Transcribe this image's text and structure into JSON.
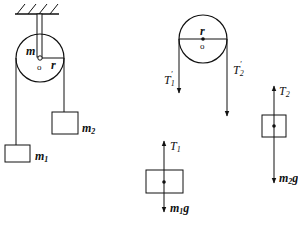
{
  "diagram": {
    "left_system": {
      "pulley_mass_label": "m",
      "radius_label": "r",
      "center_label": "o",
      "mass1_label": "m",
      "mass1_sub": "1",
      "mass2_label": "m",
      "mass2_sub": "2"
    },
    "pulley_fbd": {
      "radius_label": "r",
      "center_label": "o",
      "tension1_label": "T",
      "tension1_sub": "1",
      "tension1_prime": "′",
      "tension2_label": "T",
      "tension2_sub": "2",
      "tension2_prime": "′"
    },
    "mass1_fbd": {
      "up_force_label": "T",
      "up_force_sub": "1",
      "down_force_label": "m",
      "down_force_sub": "1",
      "down_force_g": "g"
    },
    "mass2_fbd": {
      "up_force_label": "T",
      "up_force_sub": "2",
      "down_force_label": "m",
      "down_force_sub": "2",
      "down_force_g": "g"
    },
    "colors": {
      "stroke": "#111111",
      "background": "#ffffff"
    }
  }
}
